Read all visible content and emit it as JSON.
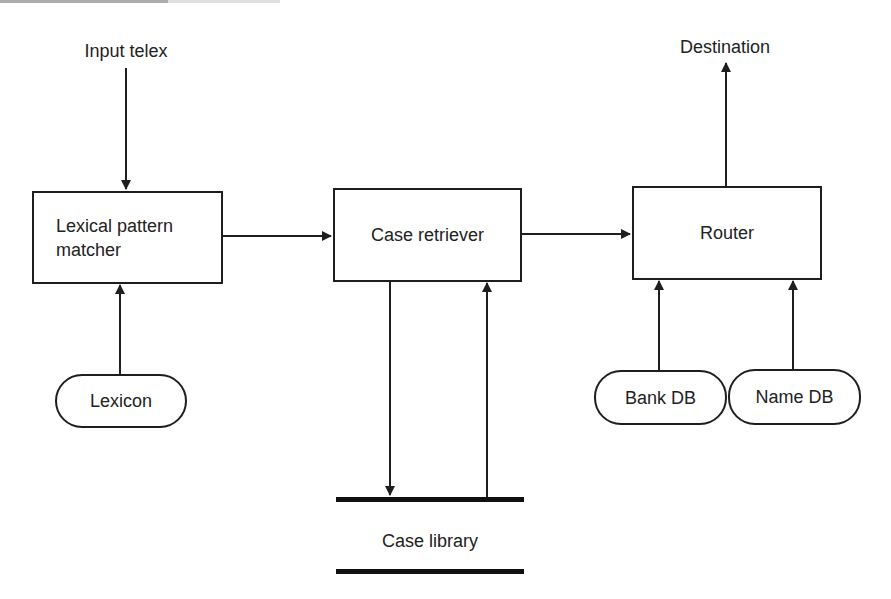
{
  "diagram": {
    "type": "flowchart",
    "style": {
      "stroke_color": "#1e1e1e",
      "text_color": "#222222",
      "background": "#ffffff"
    },
    "inputs": {
      "input_telex": "Input telex",
      "destination": "Destination"
    },
    "process_nodes": [
      {
        "id": "lexical",
        "label": "Lexical pattern matcher",
        "line1": "Lexical pattern",
        "line2": "matcher"
      },
      {
        "id": "retriever",
        "label": "Case retriever"
      },
      {
        "id": "router",
        "label": "Router"
      }
    ],
    "data_sources": [
      {
        "id": "lexicon",
        "label": "Lexicon"
      },
      {
        "id": "bankdb",
        "label": "Bank DB"
      },
      {
        "id": "namedb",
        "label": "Name DB"
      }
    ],
    "data_store": {
      "id": "caselib",
      "label": "Case library"
    },
    "edges": [
      {
        "from": "Input telex",
        "to": "Lexical pattern matcher"
      },
      {
        "from": "Lexicon",
        "to": "Lexical pattern matcher"
      },
      {
        "from": "Lexical pattern matcher",
        "to": "Case retriever"
      },
      {
        "from": "Case retriever",
        "to": "Case library"
      },
      {
        "from": "Case library",
        "to": "Case retriever"
      },
      {
        "from": "Case retriever",
        "to": "Router"
      },
      {
        "from": "Bank DB",
        "to": "Router"
      },
      {
        "from": "Name DB",
        "to": "Router"
      },
      {
        "from": "Router",
        "to": "Destination"
      }
    ]
  }
}
